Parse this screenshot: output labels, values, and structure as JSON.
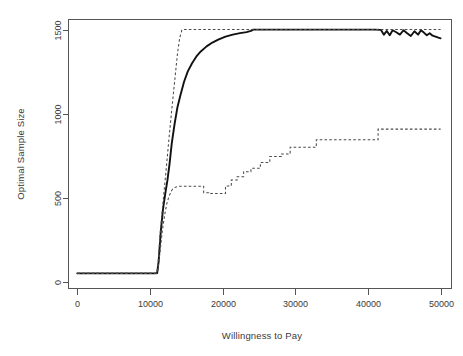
{
  "figure": {
    "background_color": "#ffffff",
    "solid_line_color": "#111111",
    "dashed_line_color": "#4a4a4a",
    "axis_color": "#555555",
    "text_color": "#3a3a3a",
    "ghost_title": ""
  },
  "chart_data": {
    "type": "line",
    "title": "",
    "xlabel": "Willingness to Pay",
    "ylabel": "Optimal Sample Size",
    "xlim": [
      -1200,
      51500
    ],
    "ylim": [
      -40,
      1560
    ],
    "xticks": [
      0,
      10000,
      20000,
      30000,
      40000,
      50000
    ],
    "xticklabels": [
      "0",
      "10000",
      "20000",
      "30000",
      "40000",
      "50000"
    ],
    "yticks": [
      0,
      500,
      1000,
      1500
    ],
    "yticklabels": [
      "0",
      "500",
      "1000",
      "1500"
    ],
    "grid": false,
    "legend": "none",
    "frame": "box",
    "series": [
      {
        "name": "optimal-sample-size-mean",
        "style": "solid",
        "x": [
          0,
          2000,
          4000,
          6000,
          8000,
          10000,
          10800,
          11000,
          11200,
          11500,
          11800,
          12100,
          12400,
          12700,
          13000,
          13400,
          13800,
          14200,
          14700,
          15200,
          15800,
          16400,
          17000,
          17800,
          18600,
          19400,
          20400,
          21400,
          22400,
          23300,
          23900,
          24200,
          25000,
          27000,
          29000,
          31000,
          33000,
          35000,
          37000,
          39000,
          41000,
          41800,
          42200,
          42600,
          43000,
          43400,
          43900,
          44400,
          44900,
          45400,
          45900,
          46400,
          46900,
          47300,
          47700,
          48100,
          48500,
          48900,
          49300,
          49700,
          50000
        ],
        "y": [
          50,
          50,
          50,
          50,
          50,
          50,
          50,
          52,
          120,
          300,
          430,
          520,
          600,
          700,
          820,
          940,
          1040,
          1110,
          1190,
          1250,
          1300,
          1340,
          1370,
          1400,
          1423,
          1440,
          1458,
          1470,
          1479,
          1485,
          1492,
          1500,
          1500,
          1500,
          1500,
          1500,
          1500,
          1500,
          1500,
          1500,
          1500,
          1498,
          1470,
          1492,
          1466,
          1496,
          1484,
          1470,
          1496,
          1478,
          1462,
          1490,
          1470,
          1496,
          1482,
          1466,
          1478,
          1464,
          1458,
          1452,
          1448
        ]
      },
      {
        "name": "optimal-sample-size-upper",
        "style": "dashed",
        "x": [
          0,
          2000,
          4000,
          6000,
          8000,
          10000,
          10900,
          11100,
          11400,
          11800,
          12200,
          12600,
          13000,
          13400,
          13800,
          14100,
          14400,
          14500,
          16000,
          20000,
          25000,
          30000,
          35000,
          40000,
          45000,
          50000
        ],
        "y": [
          50,
          50,
          50,
          50,
          50,
          50,
          50,
          90,
          280,
          470,
          650,
          840,
          1020,
          1190,
          1360,
          1450,
          1498,
          1500,
          1500,
          1500,
          1500,
          1500,
          1500,
          1500,
          1500,
          1500
        ]
      },
      {
        "name": "optimal-sample-size-lower",
        "style": "dashed",
        "x": [
          0,
          2000,
          4000,
          6000,
          8000,
          10000,
          10900,
          11100,
          11400,
          11700,
          12000,
          12300,
          12600,
          12900,
          13100,
          13400,
          13700,
          14000,
          14000,
          17400,
          17400,
          18100,
          18100,
          20400,
          20400,
          21200,
          21200,
          22000,
          22000,
          22900,
          22900,
          23900,
          23900,
          25200,
          25200,
          26500,
          26500,
          28100,
          28100,
          29300,
          29300,
          32900,
          32900,
          41400,
          41400,
          50000
        ],
        "y": [
          50,
          50,
          50,
          50,
          50,
          50,
          50,
          70,
          180,
          300,
          390,
          460,
          505,
          535,
          550,
          560,
          565,
          568,
          568,
          568,
          530,
          530,
          525,
          525,
          570,
          570,
          605,
          605,
          625,
          625,
          655,
          655,
          675,
          675,
          710,
          710,
          745,
          745,
          760,
          760,
          800,
          800,
          845,
          845,
          908,
          908
        ]
      }
    ]
  },
  "annotations": {
    "baseline_value": 50,
    "plateau_value": 1500,
    "rise_onset_wtp": 11000,
    "solid_plateau_wtp": 24200,
    "upper_plateau_wtp": 14500,
    "lower_final_value": 908
  }
}
